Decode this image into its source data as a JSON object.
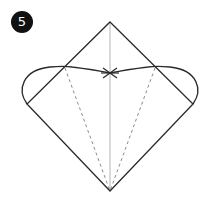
{
  "diagram": {
    "step_number": "5",
    "colors": {
      "badge_bg": "#111111",
      "badge_text": "#ffffff",
      "outline": "#2a2a2a",
      "center_line": "#b5b5b5",
      "dashed_line": "#8a8a8a",
      "background": "#ffffff"
    },
    "shapes": {
      "diamond": {
        "top": [
          110,
          22
        ],
        "right": [
          193,
          104
        ],
        "bottom": [
          110,
          191
        ],
        "left": [
          27,
          104
        ]
      },
      "center_fold_line": {
        "from": [
          110,
          22
        ],
        "to": [
          110,
          191
        ]
      },
      "left_flap_curve": {
        "start": [
          27,
          104
        ],
        "via": [
          23,
          70
        ],
        "cross": [
          65,
          67
        ],
        "end": [
          110,
          73
        ]
      },
      "right_flap_curve": {
        "start": [
          193,
          104
        ],
        "via": [
          198,
          70
        ],
        "cross": [
          153,
          67
        ],
        "end": [
          110,
          73
        ]
      },
      "dashed_fold_left": {
        "from": [
          65,
          68
        ],
        "to": [
          110,
          191
        ]
      },
      "dashed_fold_right": {
        "from": [
          155,
          68
        ],
        "to": [
          110,
          191
        ]
      }
    }
  }
}
